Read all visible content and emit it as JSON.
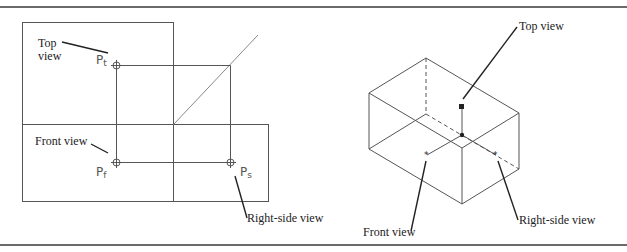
{
  "figure": {
    "left_panel": {
      "title": "Orthographic projection of point P",
      "labels": {
        "top_view": [
          "Top",
          "view"
        ],
        "front_view": "Front view",
        "right_side_view": "Right-side view"
      },
      "points": {
        "top": {
          "main": "P",
          "sub": "t"
        },
        "front": {
          "main": "P",
          "sub": "f"
        },
        "side": {
          "main": "P",
          "sub": "s"
        }
      }
    },
    "right_panel": {
      "title": "Isometric view of glass box with point projections",
      "labels": {
        "top_view": "Top view",
        "front_view": "Front view",
        "right_side_view": "Right-side view"
      }
    },
    "colors": {
      "line": "#555555",
      "leader": "#222222",
      "rule": "#6a6a6a",
      "text": "#222222"
    }
  }
}
